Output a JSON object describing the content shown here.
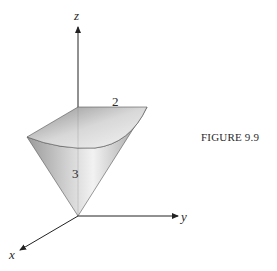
{
  "figure": {
    "caption": "FIGURE 9.9",
    "axes": {
      "x_label": "x",
      "y_label": "y",
      "z_label": "z"
    },
    "dimension_labels": {
      "radius": "2",
      "height": "3"
    }
  }
}
